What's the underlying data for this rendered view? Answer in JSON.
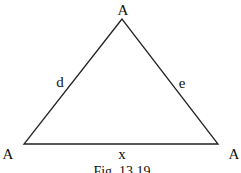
{
  "figure": {
    "caption": "Fig. 13.19",
    "vertices": {
      "top": "A",
      "bottom_left": "A",
      "bottom_right": "A"
    },
    "sides": {
      "left": "d",
      "right": "e",
      "bottom": "x"
    },
    "line_color": "#222222"
  }
}
